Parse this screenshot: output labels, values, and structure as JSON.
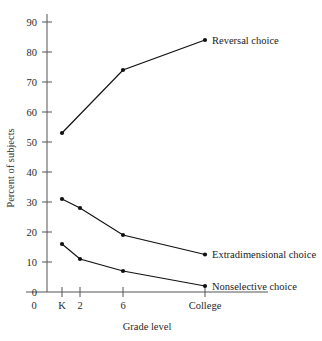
{
  "chart_data": {
    "type": "line",
    "title": "",
    "xlabel": "Grade level",
    "ylabel": "Percent of subjects",
    "categories": [
      "K",
      "2",
      "6",
      "College"
    ],
    "x_tick_labels": [
      "0",
      "K",
      "2",
      "6",
      "College"
    ],
    "y_tick_labels": [
      "0",
      "10",
      "20",
      "30",
      "40",
      "50",
      "60",
      "70",
      "80",
      "90"
    ],
    "y_ticks": [
      0,
      10,
      20,
      30,
      40,
      50,
      60,
      70,
      80,
      90
    ],
    "ylim": [
      0,
      95
    ],
    "grid": false,
    "legend_position": "inline-right",
    "series": [
      {
        "name": "Reversal choice",
        "label": "Reversal choice",
        "x": [
          "K",
          "6",
          "College"
        ],
        "values": [
          53,
          74,
          84
        ],
        "color": "#111111",
        "marker": "filled-circle"
      },
      {
        "name": "Extradimensional choice",
        "label": "Extradimensional choice",
        "x": [
          "K",
          "2",
          "6",
          "College"
        ],
        "values": [
          31,
          28,
          19,
          12.5
        ],
        "color": "#111111",
        "marker": "filled-circle"
      },
      {
        "name": "Nonselective choice",
        "label": "Nonselective choice",
        "x": [
          "K",
          "2",
          "6",
          "College"
        ],
        "values": [
          16,
          11,
          7,
          2
        ],
        "color": "#111111",
        "marker": "filled-circle"
      }
    ],
    "annotations": []
  },
  "geometry": {
    "x_positions": {
      "K": 62,
      "2": 80,
      "6": 123,
      "College": 205
    },
    "zero_tick_x": 34,
    "axis_baseline_y": 292,
    "axis_top_y": 14,
    "pixels_per_unit": 3.0,
    "axis_left_x": 47
  }
}
